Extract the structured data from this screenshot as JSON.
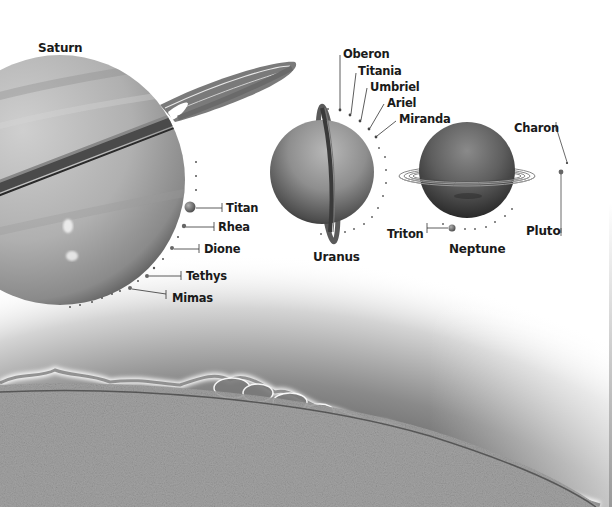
{
  "planets": {
    "saturn": {
      "name": "Saturn",
      "moons": [
        "Titan",
        "Rhea",
        "Dione",
        "Tethys",
        "Mimas"
      ]
    },
    "uranus": {
      "name": "Uranus",
      "moons": [
        "Oberon",
        "Titania",
        "Umbriel",
        "Ariel",
        "Miranda"
      ]
    },
    "neptune": {
      "name": "Neptune",
      "moons": [
        "Triton"
      ]
    },
    "pluto": {
      "name": "Pluto",
      "moons": [
        "Charon"
      ]
    }
  },
  "labels": {
    "saturn": "Saturn",
    "titan": "Titan",
    "rhea": "Rhea",
    "dione": "Dione",
    "tethys": "Tethys",
    "mimas": "Mimas",
    "oberon": "Oberon",
    "titania": "Titania",
    "umbriel": "Umbriel",
    "ariel": "Ariel",
    "miranda": "Miranda",
    "uranus": "Uranus",
    "triton": "Triton",
    "neptune": "Neptune",
    "charon": "Charon",
    "pluto": "Pluto"
  },
  "colors": {
    "background": "#ffffff",
    "text": "#1a1a1a",
    "planet_light": "#c8c8c8",
    "planet_dark": "#3a3a3a",
    "sun_surface": "#9c9c9c",
    "sun_glow": "#6e6e6e"
  }
}
